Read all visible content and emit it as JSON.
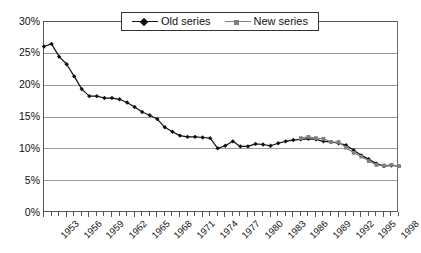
{
  "chart_data": {
    "type": "line",
    "title": "",
    "xlabel": "",
    "ylabel": "",
    "ylim": [
      0,
      30
    ],
    "ytick_labels": [
      "0%",
      "5%",
      "10%",
      "15%",
      "20%",
      "25%",
      "30%"
    ],
    "ytick_values": [
      0,
      5,
      10,
      15,
      20,
      25,
      30
    ],
    "xlim": [
      1953,
      2000
    ],
    "xtick_labels": [
      "1953",
      "1956",
      "1959",
      "1962",
      "1965",
      "1968",
      "1971",
      "1974",
      "1977",
      "1980",
      "1983",
      "1986",
      "1989",
      "1992",
      "1995",
      "1998"
    ],
    "xtick_values": [
      1953,
      1956,
      1959,
      1962,
      1965,
      1968,
      1971,
      1974,
      1977,
      1980,
      1983,
      1986,
      1989,
      1992,
      1995,
      1998
    ],
    "grid": "horizontal",
    "legend_position": "top-center",
    "legend_entries": [
      "Old series",
      "New series"
    ],
    "colors": {
      "old_series": "#111111",
      "new_series": "#808080",
      "gridline": "#9a9a9a",
      "axis": "#555555",
      "background": "#ffffff"
    },
    "markers": {
      "old_series": "diamond",
      "new_series": "square"
    },
    "series": [
      {
        "name": "Old series",
        "marker": "diamond",
        "color": "#111111",
        "x": [
          1953,
          1954,
          1955,
          1956,
          1957,
          1958,
          1959,
          1960,
          1961,
          1962,
          1963,
          1964,
          1965,
          1966,
          1967,
          1968,
          1969,
          1970,
          1971,
          1972,
          1973,
          1974,
          1975,
          1976,
          1977,
          1978,
          1979,
          1980,
          1981,
          1982,
          1983,
          1984,
          1985,
          1986,
          1987,
          1988,
          1989,
          1990,
          1991,
          1992,
          1993,
          1994,
          1995,
          1996,
          1997,
          1998,
          1999,
          2000
        ],
        "values": [
          26.0,
          26.4,
          24.4,
          23.2,
          21.3,
          19.3,
          18.2,
          18.2,
          17.9,
          17.9,
          17.7,
          17.2,
          16.5,
          15.7,
          15.2,
          14.6,
          13.3,
          12.6,
          12.0,
          11.8,
          11.8,
          11.7,
          11.6,
          10.0,
          10.4,
          11.1,
          10.3,
          10.3,
          10.7,
          10.6,
          10.4,
          10.8,
          11.1,
          11.3,
          11.4,
          11.5,
          11.4,
          11.1,
          11.0,
          10.8,
          10.5,
          9.7,
          8.9,
          8.3,
          7.6,
          7.2,
          7.3,
          7.2
        ]
      },
      {
        "name": "New series",
        "marker": "square",
        "color": "#808080",
        "x": [
          1987,
          1988,
          1989,
          1990,
          1991,
          1992,
          1993,
          1994,
          1995,
          1996,
          1997,
          1998,
          1999,
          2000
        ],
        "values": [
          11.6,
          11.8,
          11.6,
          11.5,
          11.0,
          11.0,
          10.1,
          9.3,
          8.7,
          8.0,
          7.4,
          7.3,
          7.4,
          7.2
        ]
      }
    ]
  }
}
